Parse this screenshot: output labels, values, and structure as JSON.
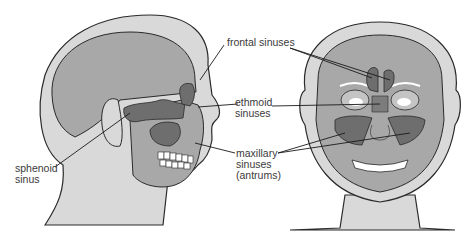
{
  "diagram": {
    "views": [
      {
        "id": "side",
        "label": "Lateral view of head"
      },
      {
        "id": "front",
        "label": "Frontal view of face"
      }
    ],
    "labels": {
      "frontal": "frontal sinuses",
      "ethmoid_line1": "ethmoid",
      "ethmoid_line2": "sinuses",
      "maxillary_line1": "maxillary",
      "maxillary_line2": "sinuses",
      "maxillary_line3": "(antrums)",
      "sphenoid_line1": "sphenoid",
      "sphenoid_line2": "sinus"
    },
    "colors": {
      "skin": "#d9d9d9",
      "skull": "#a8a8a8",
      "sinus": "#6e6e6e",
      "outline": "#2a2a2a",
      "teeth": "#ffffff"
    }
  }
}
